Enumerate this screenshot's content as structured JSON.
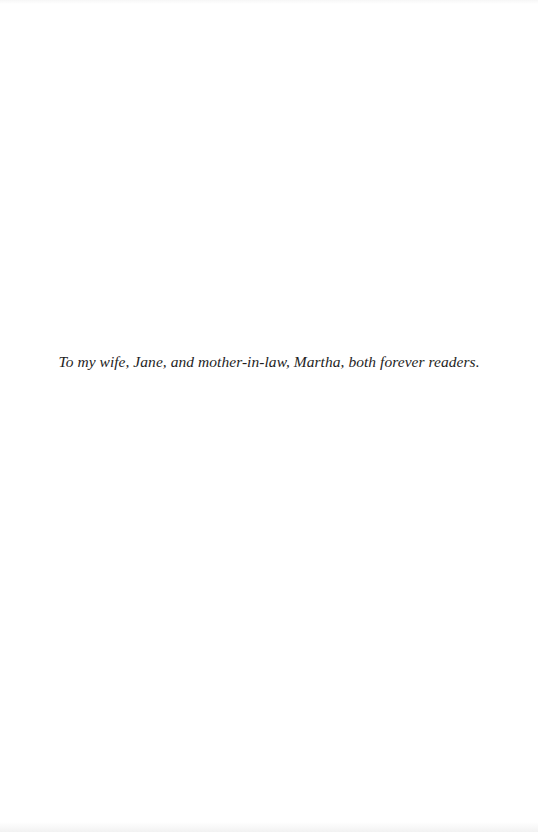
{
  "page": {
    "type": "dedication",
    "dedication_text": "To my wife, Jane, and mother-in-law, Martha, both forever readers."
  }
}
